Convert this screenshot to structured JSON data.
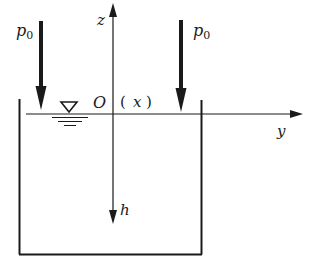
{
  "diagram": {
    "labels": {
      "pressure_left": "p",
      "pressure_left_sub": "0",
      "pressure_right": "p",
      "pressure_right_sub": "0",
      "z_axis": "z",
      "y_axis": "y",
      "h_axis": "h",
      "origin": "O",
      "x_axis_paren_open": "(",
      "x_axis": "x",
      "x_axis_paren_close": ")"
    },
    "colors": {
      "stroke": "#1a1a1a",
      "background": "#ffffff"
    }
  }
}
